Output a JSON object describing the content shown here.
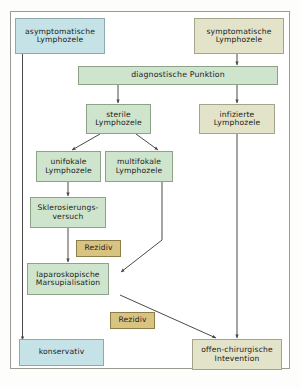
{
  "figure": {
    "title_semantic": "algorithmus-lymphozele",
    "language": "de",
    "colors": {
      "blue": "#c5e2e6",
      "green": "#cfe4cd",
      "olive": "#e2e3c8",
      "gold": "#d9c380",
      "border": "#8e9a8c",
      "frame": "#9a9a92",
      "line": "#4a4a48",
      "text": "#1d1d1b"
    }
  },
  "nodes": {
    "asymptomatisch": {
      "line1": "asymptomatische",
      "line2": "Lymphozele",
      "color": "blue"
    },
    "symptomatisch": {
      "line1": "symptomatische",
      "line2": "Lymphozele",
      "color": "olive"
    },
    "punktion": {
      "line1": "diagnostische Punktion",
      "line2": "",
      "color": "green"
    },
    "steril": {
      "line1": "sterile",
      "line2": "Lymphozele",
      "color": "green"
    },
    "infiziert": {
      "line1": "infizierte",
      "line2": "Lymphozele",
      "color": "olive"
    },
    "unifokal": {
      "line1": "unifokale",
      "line2": "Lymphozele",
      "color": "green"
    },
    "multifokal": {
      "line1": "multifokale",
      "line2": "Lymphozele",
      "color": "green"
    },
    "sklerosierung": {
      "line1": "Sklerosierungs-",
      "line2": "versuch",
      "color": "green"
    },
    "rezidiv1": {
      "line1": "Rezidiv",
      "line2": "",
      "color": "gold"
    },
    "marsupialisation": {
      "line1": "laparoskopische",
      "line2": "Marsupialisation",
      "color": "green"
    },
    "rezidiv2": {
      "line1": "Rezidiv",
      "line2": "",
      "color": "gold"
    },
    "konservativ": {
      "line1": "konservativ",
      "line2": "",
      "color": "blue"
    },
    "offenchirurgisch": {
      "line1": "offen-chirurgische",
      "line2": "Intevention",
      "color": "olive"
    }
  },
  "edges": [
    {
      "from": "asymptomatisch",
      "to": "konservativ",
      "style": "elbow-left"
    },
    {
      "from": "symptomatisch",
      "to": "punktion",
      "style": "vertical"
    },
    {
      "from": "punktion",
      "to": "steril",
      "style": "vertical"
    },
    {
      "from": "punktion",
      "to": "infiziert",
      "style": "vertical"
    },
    {
      "from": "steril",
      "to": "unifokal",
      "style": "diagonal"
    },
    {
      "from": "steril",
      "to": "multifokal",
      "style": "diagonal"
    },
    {
      "from": "unifokal",
      "to": "sklerosierung",
      "style": "vertical"
    },
    {
      "from": "sklerosierung",
      "to": "marsupialisation",
      "style": "vertical-via-rezidiv"
    },
    {
      "from": "multifokal",
      "to": "marsupialisation",
      "style": "elbow-diagonal"
    },
    {
      "from": "marsupialisation",
      "to": "offenchirurgisch",
      "style": "diagonal-via-rezidiv"
    },
    {
      "from": "infiziert",
      "to": "offenchirurgisch",
      "style": "vertical"
    }
  ]
}
